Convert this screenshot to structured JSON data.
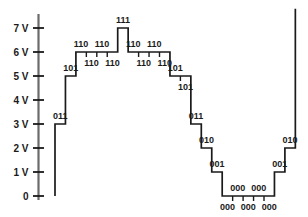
{
  "figure": {
    "title": "",
    "background_color": "#ffffff",
    "trace_color": "#1a1a1a",
    "axis_color": "#4d4d4d",
    "text_color": "#1a1a1a"
  },
  "yaxis": {
    "unit": "V",
    "ticks": [
      {
        "label": "7 V",
        "value": 7
      },
      {
        "label": "6 V",
        "value": 6
      },
      {
        "label": "5 V",
        "value": 5
      },
      {
        "label": "4 V",
        "value": 4
      },
      {
        "label": "3 V",
        "value": 3
      },
      {
        "label": "2 V",
        "value": 2
      },
      {
        "label": "1 V",
        "value": 1
      },
      {
        "label": "0",
        "value": 0
      }
    ]
  },
  "chart_data": {
    "type": "line",
    "title": "",
    "xlabel": "",
    "ylabel": "",
    "ylim": [
      0,
      7.6
    ],
    "grid": false,
    "legend": "none",
    "categories": [
      "011",
      "101",
      "110",
      "110",
      "110",
      "110",
      "111",
      "110",
      "110",
      "110",
      "110",
      "101",
      "101",
      "011",
      "010",
      "001",
      "000",
      "000",
      "000",
      "000",
      "000",
      "001",
      "010"
    ],
    "values": [
      3,
      5,
      6,
      6,
      6,
      6,
      7,
      6,
      6,
      6,
      6,
      5,
      5,
      3,
      2,
      1,
      0,
      0,
      0,
      0,
      0,
      1,
      2
    ],
    "step_labels": [
      {
        "code": "011",
        "volts": 3,
        "index": 0,
        "placement": "above"
      },
      {
        "code": "101",
        "volts": 5,
        "index": 1,
        "placement": "above"
      },
      {
        "code": "110",
        "volts": 6,
        "index": 2,
        "placement": "above"
      },
      {
        "code": "110",
        "volts": 6,
        "index": 3,
        "placement": "below"
      },
      {
        "code": "110",
        "volts": 6,
        "index": 4,
        "placement": "above"
      },
      {
        "code": "110",
        "volts": 6,
        "index": 5,
        "placement": "below"
      },
      {
        "code": "111",
        "volts": 7,
        "index": 6,
        "placement": "above"
      },
      {
        "code": "110",
        "volts": 6,
        "index": 7,
        "placement": "above"
      },
      {
        "code": "110",
        "volts": 6,
        "index": 8,
        "placement": "below"
      },
      {
        "code": "110",
        "volts": 6,
        "index": 9,
        "placement": "above"
      },
      {
        "code": "110",
        "volts": 6,
        "index": 10,
        "placement": "below"
      },
      {
        "code": "101",
        "volts": 5,
        "index": 11,
        "placement": "above"
      },
      {
        "code": "101",
        "volts": 5,
        "index": 12,
        "placement": "below"
      },
      {
        "code": "011",
        "volts": 3,
        "index": 13,
        "placement": "above"
      },
      {
        "code": "010",
        "volts": 2,
        "index": 14,
        "placement": "above"
      },
      {
        "code": "001",
        "volts": 1,
        "index": 15,
        "placement": "above"
      },
      {
        "code": "000",
        "volts": 0,
        "index": 16,
        "placement": "below"
      },
      {
        "code": "000",
        "volts": 0,
        "index": 17,
        "placement": "above"
      },
      {
        "code": "000",
        "volts": 0,
        "index": 18,
        "placement": "below"
      },
      {
        "code": "000",
        "volts": 0,
        "index": 19,
        "placement": "above"
      },
      {
        "code": "000",
        "volts": 0,
        "index": 20,
        "placement": "below"
      },
      {
        "code": "001",
        "volts": 1,
        "index": 21,
        "placement": "above"
      },
      {
        "code": "010",
        "volts": 2,
        "index": 22,
        "placement": "above"
      }
    ]
  }
}
